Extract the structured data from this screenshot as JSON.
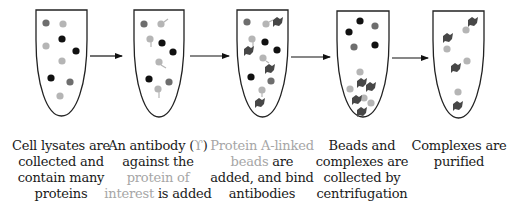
{
  "colors": {
    "black_protein": "#111111",
    "dark_protein": "#6e6e6e",
    "light_protein": "#b5b5b5",
    "bead": "#474747",
    "outline": "#222222",
    "highlight_text": "#a6a6a6"
  },
  "steps": [
    {
      "id": 1,
      "caption_parts": [
        {
          "text": "Cell lysates are collected and contain many proteins",
          "style": "normal"
        }
      ]
    },
    {
      "id": 2,
      "caption_parts": [
        {
          "text": "An antibody (",
          "style": "normal"
        },
        {
          "text": "Y",
          "style": "glyph"
        },
        {
          "text": ") against the ",
          "style": "normal"
        },
        {
          "text": "protein of interest",
          "style": "highlight"
        },
        {
          "text": " is added",
          "style": "normal"
        }
      ]
    },
    {
      "id": 3,
      "caption_parts": [
        {
          "text": "Protein A-linked beads",
          "style": "highlight"
        },
        {
          "text": " are added, and bind antibodies",
          "style": "normal"
        }
      ]
    },
    {
      "id": 4,
      "caption_parts": [
        {
          "text": "Beads and complexes are collected by centrifugation",
          "style": "normal"
        }
      ]
    },
    {
      "id": 5,
      "caption_parts": [
        {
          "text": "Complexes are purified",
          "style": "normal"
        }
      ]
    }
  ],
  "captions": {
    "c1": {
      "a": "Cell lysates are collected and contain many proteins"
    },
    "c2": {
      "a": "An antibody (",
      "glyph": "ϒ",
      "b": ") against the ",
      "hl": "protein of interest",
      "c": " is added"
    },
    "c3": {
      "hl": "Protein A-linked beads",
      "a": " are added, and bind antibodies"
    },
    "c4": {
      "a": "Beads and complexes are collected by centrifugation"
    },
    "c5": {
      "a": "Complexes are purified"
    }
  },
  "arrows": [
    {
      "from": 1,
      "to": 2
    },
    {
      "from": 2,
      "to": 3
    },
    {
      "from": 3,
      "to": 4
    },
    {
      "from": 4,
      "to": 5
    }
  ]
}
